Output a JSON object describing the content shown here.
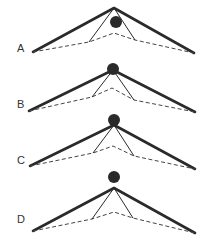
{
  "figure": {
    "colors": {
      "line": "#2a2a2a",
      "dash": "#444444",
      "background": "#ffffff"
    },
    "panels": [
      {
        "label": "A",
        "label_pos": [
          17,
          52
        ],
        "apex": [
          114,
          8
        ],
        "left_end": [
          33,
          52
        ],
        "right_end": [
          194,
          53
        ],
        "dash_apex": [
          114,
          33
        ],
        "left_knee": [
          89,
          42
        ],
        "right_knee": [
          135,
          40
        ],
        "dot": {
          "cx": 116,
          "cy": 22,
          "r": 6
        },
        "dot_position": "below apex"
      },
      {
        "label": "B",
        "label_pos": [
          17,
          108
        ],
        "apex": [
          113,
          70
        ],
        "left_end": [
          29,
          111
        ],
        "right_end": [
          195,
          112
        ],
        "dash_apex": [
          112,
          88
        ],
        "left_knee": [
          92,
          97
        ],
        "right_knee": [
          134,
          100
        ],
        "dot": {
          "cx": 113,
          "cy": 69,
          "r": 6
        },
        "dot_position": "at apex"
      },
      {
        "label": "C",
        "label_pos": [
          17,
          164
        ],
        "apex": [
          114,
          125
        ],
        "left_end": [
          30,
          166
        ],
        "right_end": [
          195,
          169
        ],
        "dash_apex": [
          113,
          146
        ],
        "left_knee": [
          93,
          153
        ],
        "right_knee": [
          134,
          156
        ],
        "dot": {
          "cx": 114,
          "cy": 120,
          "r": 6
        },
        "dot_position": "slightly above apex"
      },
      {
        "label": "D",
        "label_pos": [
          17,
          223
        ],
        "apex": [
          114,
          188
        ],
        "left_end": [
          33,
          231
        ],
        "right_end": [
          195,
          233
        ],
        "dash_apex": [
          114,
          212
        ],
        "left_knee": [
          92,
          219
        ],
        "right_knee": [
          133,
          218
        ],
        "dot": {
          "cx": 114,
          "cy": 177,
          "r": 6
        },
        "dot_position": "above apex"
      }
    ]
  }
}
